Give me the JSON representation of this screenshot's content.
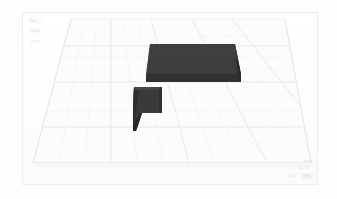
{
  "app": {
    "title": "3D Model Viewport",
    "background_color": "#fefefe",
    "frame_border_color": "#ededed"
  },
  "viewport": {
    "name": "3d-scene-viewport",
    "plate_fill": "#fcfcfc",
    "grid_line_color": "#f0f0f0",
    "grid_major_color": "#e8e8e8",
    "plate_edge_color": "#e6e6e6"
  },
  "sidebar": {
    "items": [
      {
        "label": "Part",
        "state": "normal"
      },
      {
        "label": "Object",
        "state": "selected"
      },
      {
        "label": "Layers",
        "state": "muted"
      }
    ],
    "axis_hint": "Z"
  },
  "models": [
    {
      "name": "rectangular-plate",
      "top_color": "#3d3d3d",
      "side_color": "#313131",
      "edge_color": "#2b2b2b"
    },
    {
      "name": "concave-fillet-wedge",
      "top_color": "#3a3a3a",
      "side_color": "#2e2e2e",
      "edge_color": "#272727"
    }
  ],
  "status": {
    "dimension_readout": "80 x 40",
    "lines": [
      "Ready",
      "100%"
    ],
    "chip": "mm"
  }
}
